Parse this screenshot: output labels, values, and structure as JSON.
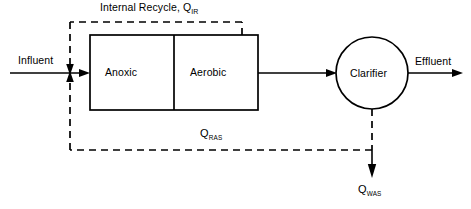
{
  "diagram": {
    "stream_colors": {
      "line": "#000000",
      "background": "#ffffff"
    },
    "units": [
      {
        "id": "anoxic",
        "label": "Anoxic",
        "shape": "rectangle"
      },
      {
        "id": "aerobic",
        "label": "Aerobic",
        "shape": "rectangle"
      },
      {
        "id": "clarifier",
        "label": "Clarifier",
        "shape": "circle"
      }
    ],
    "streams": [
      {
        "id": "influent",
        "label": "Influent",
        "style": "solid"
      },
      {
        "id": "effluent",
        "label": "Effluent",
        "style": "solid"
      },
      {
        "id": "internal-recycle",
        "label": "Internal Recycle, Q",
        "subscript": "IR",
        "style": "dashed"
      },
      {
        "id": "ras",
        "label": "Q",
        "subscript": "RAS",
        "style": "dashed"
      },
      {
        "id": "was",
        "label": "Q",
        "subscript": "WAS",
        "style": "dashed"
      }
    ]
  }
}
